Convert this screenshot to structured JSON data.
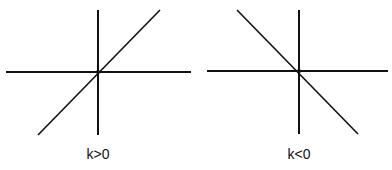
{
  "diagrams": [
    {
      "label": "k>0",
      "slope_sign": "positive",
      "x_axis": {
        "x1": 6,
        "y1": 72,
        "x2": 191,
        "y2": 72
      },
      "y_axis": {
        "x1": 98,
        "y1": 10,
        "x2": 98,
        "y2": 135
      },
      "line": {
        "x1": 38,
        "y1": 135,
        "x2": 160,
        "y2": 10
      },
      "label_pos": {
        "x": 68,
        "y": 146
      }
    },
    {
      "label": "k<0",
      "slope_sign": "negative",
      "x_axis": {
        "x1": 207,
        "y1": 71,
        "x2": 388,
        "y2": 71
      },
      "y_axis": {
        "x1": 299,
        "y1": 10,
        "x2": 299,
        "y2": 134
      },
      "line": {
        "x1": 237,
        "y1": 10,
        "x2": 358,
        "y2": 134
      },
      "label_pos": {
        "x": 269,
        "y": 146
      }
    }
  ],
  "colors": {
    "stroke": "#111111",
    "background": "#ffffff"
  }
}
